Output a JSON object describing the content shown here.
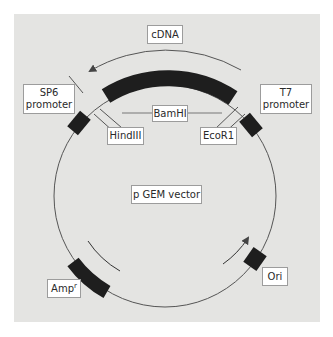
{
  "diagram": {
    "type": "plasmid-map",
    "title": "p GEM vector",
    "colors": {
      "background_panel": "#e4e4e2",
      "plasmid_line": "#555555",
      "feature_block": "#1e1e1e",
      "label_box_fill": "#ffffff",
      "label_box_border": "#9c9c9c"
    },
    "insert": {
      "label": "cDNA",
      "direction": "counterclockwise"
    },
    "restriction_sites": [
      {
        "name": "BamHI"
      },
      {
        "name": "HindIII"
      },
      {
        "name": "EcoR1"
      }
    ],
    "promoters": [
      {
        "name": "SP6",
        "line2": "promoter"
      },
      {
        "name": "T7",
        "line2": "promoter"
      }
    ],
    "markers": {
      "amp_base": "Amp",
      "amp_superscript": "r",
      "origin": "Ori"
    },
    "vector_label": "p GEM vector"
  }
}
